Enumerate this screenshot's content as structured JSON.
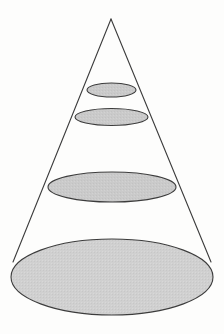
{
  "figure": {
    "name": "cone-with-parallel-cross-sections",
    "title": "",
    "caption": "",
    "background_color": "#fdfdfc",
    "width": 224,
    "height": 334
  },
  "style": {
    "outline_color": "#3c3c3c",
    "outline_width": 1.1,
    "section_fill": "#c9c9c9",
    "base_fill": "#cfcfcf",
    "cone_body_fill": "none",
    "texture": "fine-stipple"
  },
  "geometry": {
    "apex": {
      "x": 111,
      "y": 19,
      "label": ""
    },
    "axis": {
      "x": 112,
      "top_y": 19,
      "bottom_y": 277
    },
    "left_edge": {
      "x1": 111,
      "y1": 19,
      "x2": 13,
      "y2": 262
    },
    "right_edge": {
      "x1": 111,
      "y1": 19,
      "x2": 211,
      "y2": 262
    },
    "base_ellipse": {
      "cx": 112,
      "cy": 277,
      "rx": 101,
      "ry": 38
    },
    "cross_sections": [
      {
        "index": 1,
        "cx": 111.5,
        "cy": 90,
        "rx": 24.5,
        "ry": 7.0,
        "label": ""
      },
      {
        "index": 2,
        "cx": 111.5,
        "cy": 117,
        "rx": 36.5,
        "ry": 8.5,
        "label": ""
      },
      {
        "index": 3,
        "cx": 112.0,
        "cy": 187,
        "rx": 64.0,
        "ry": 15.0,
        "label": ""
      }
    ]
  },
  "labels": {
    "items": []
  },
  "chart_data": {
    "type": "diagram",
    "title": "",
    "shapes": [
      {
        "name": "cross-section-1",
        "kind": "ellipse",
        "rx": 24.5,
        "ry": 7.0,
        "center_y": 90,
        "filled": true
      },
      {
        "name": "cross-section-2",
        "kind": "ellipse",
        "rx": 36.5,
        "ry": 8.5,
        "center_y": 117,
        "filled": true
      },
      {
        "name": "cross-section-3",
        "kind": "ellipse",
        "rx": 64.0,
        "ry": 15.0,
        "center_y": 187,
        "filled": true
      },
      {
        "name": "base",
        "kind": "ellipse",
        "rx": 101.0,
        "ry": 38.0,
        "center_y": 277,
        "filled": true
      }
    ]
  }
}
